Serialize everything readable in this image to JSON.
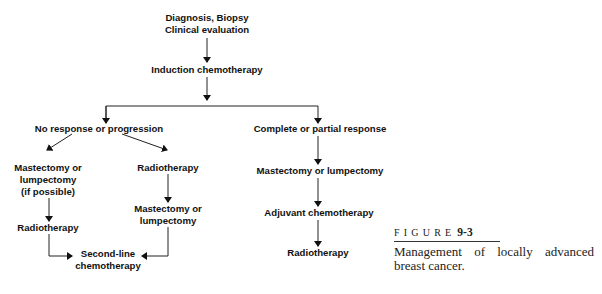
{
  "diagram": {
    "type": "flowchart",
    "nodes": {
      "start": {
        "lines": [
          "Diagnosis, Biopsy",
          "Clinical evaluation"
        ]
      },
      "induction": {
        "lines": [
          "Induction chemotherapy"
        ]
      },
      "no_response": {
        "lines": [
          "No response or progression"
        ]
      },
      "response": {
        "lines": [
          "Complete or partial response"
        ]
      },
      "left_surgery": {
        "lines": [
          "Mastectomy or",
          "lumpectomy",
          "(if possible)"
        ]
      },
      "left_radio": {
        "lines": [
          "Radiotherapy"
        ]
      },
      "mid_radio": {
        "lines": [
          "Radiotherapy"
        ]
      },
      "mid_surgery": {
        "lines": [
          "Mastectomy or",
          "lumpectomy"
        ]
      },
      "second_line": {
        "lines": [
          "Second-line",
          "chemotherapy"
        ]
      },
      "right_surgery": {
        "lines": [
          "Mastectomy or lumpectomy"
        ]
      },
      "adjuvant": {
        "lines": [
          "Adjuvant chemotherapy"
        ]
      },
      "right_radio": {
        "lines": [
          "Radiotherapy"
        ]
      }
    },
    "edges": [
      [
        "start",
        "induction"
      ],
      [
        "induction",
        "no_response"
      ],
      [
        "induction",
        "response"
      ],
      [
        "no_response",
        "left_surgery"
      ],
      [
        "no_response",
        "mid_radio"
      ],
      [
        "left_surgery",
        "left_radio"
      ],
      [
        "mid_radio",
        "mid_surgery"
      ],
      [
        "left_radio",
        "second_line"
      ],
      [
        "mid_surgery",
        "second_line"
      ],
      [
        "response",
        "right_surgery"
      ],
      [
        "right_surgery",
        "adjuvant"
      ],
      [
        "adjuvant",
        "right_radio"
      ]
    ]
  },
  "caption": {
    "label": "FIGURE",
    "number": "9-3",
    "text": "Management of locally advanced breast cancer."
  },
  "colors": {
    "ink": "#111111",
    "background": "#ffffff"
  }
}
